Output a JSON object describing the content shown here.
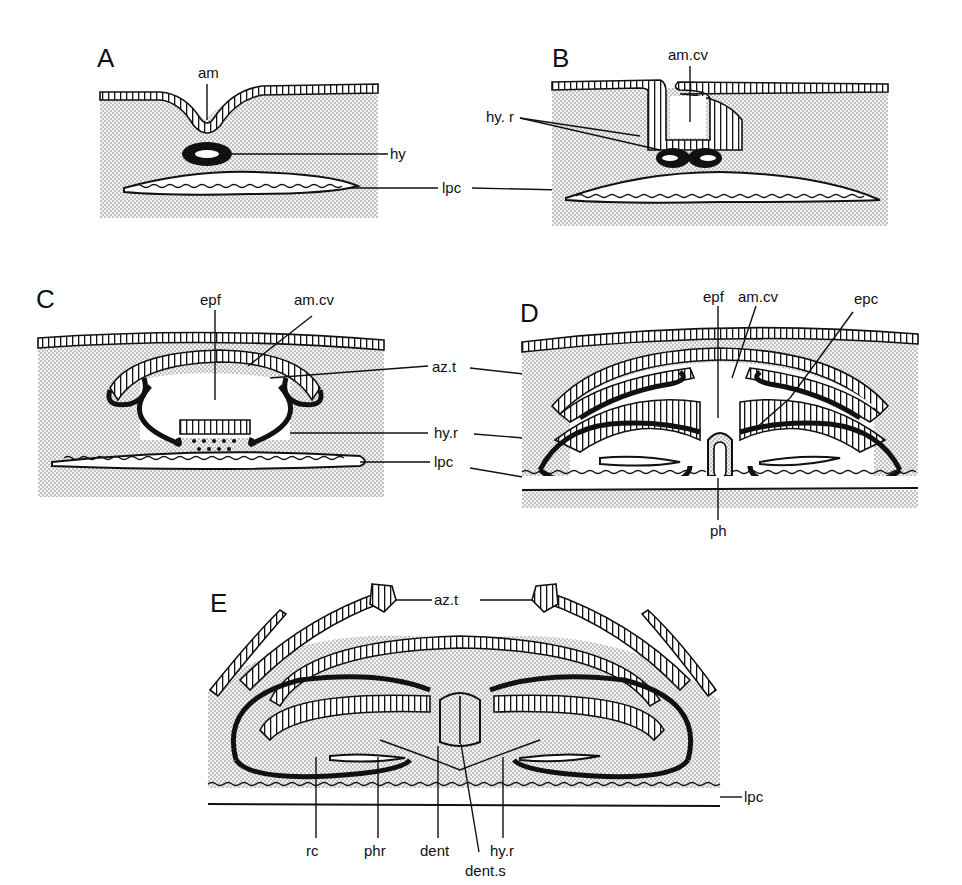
{
  "figure": {
    "panels": [
      {
        "id": "A",
        "label": "A",
        "annotations": [
          "am",
          "hy",
          "lpc"
        ]
      },
      {
        "id": "B",
        "label": "B",
        "annotations": [
          "am.cv",
          "hy. r",
          "lpc"
        ]
      },
      {
        "id": "C",
        "label": "C",
        "annotations": [
          "epf",
          "am.cv",
          "az.t",
          "hy.r",
          "lpc"
        ]
      },
      {
        "id": "D",
        "label": "D",
        "annotations": [
          "epf",
          "am.cv",
          "epc",
          "ph"
        ]
      },
      {
        "id": "E",
        "label": "E",
        "annotations": [
          "az.t",
          "lpc",
          "rc",
          "phr",
          "dent",
          "hy.r",
          "dent.s"
        ]
      }
    ],
    "shared_labels": {
      "hy": "hy",
      "lpc_ab": "lpc",
      "hyr_b": "hy. r",
      "azt_cd": "az.t",
      "hyr_cd": "hy.r",
      "lpc_cd": "lpc"
    },
    "labels": {
      "A": {
        "am": "am"
      },
      "B": {
        "amcv": "am.cv"
      },
      "C": {
        "epf": "epf",
        "amcv": "am.cv"
      },
      "D": {
        "epf": "epf",
        "amcv": "am.cv",
        "epc": "epc",
        "ph": "ph"
      },
      "E": {
        "azt": "az.t",
        "lpc": "lpc",
        "rc": "rc",
        "phr": "phr",
        "dent": "dent",
        "hyr": "hy.r",
        "dents": "dent.s"
      }
    }
  }
}
